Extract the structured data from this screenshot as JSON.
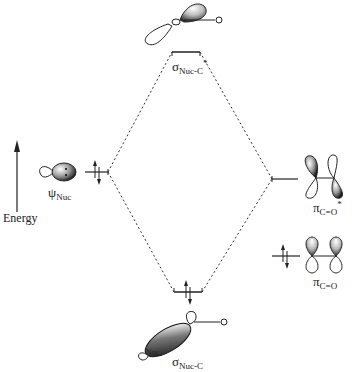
{
  "diagram": {
    "type": "molecular-orbital-energy-diagram",
    "axis": {
      "label": "Energy",
      "direction": "up"
    },
    "levels": [
      {
        "id": "psi_nuc",
        "symbol": "ψ",
        "subscript": "Nuc",
        "superscript": "",
        "electrons": 2,
        "column": "left"
      },
      {
        "id": "sigma_star",
        "symbol": "σ",
        "subscript": "Nuc-C",
        "superscript": "*",
        "electrons": 0,
        "column": "center-top"
      },
      {
        "id": "sigma",
        "symbol": "σ",
        "subscript": "Nuc-C",
        "superscript": "",
        "electrons": 2,
        "column": "center-bottom"
      },
      {
        "id": "pi_star",
        "symbol": "π",
        "subscript": "C=O",
        "superscript": "*",
        "electrons": 0,
        "column": "right"
      },
      {
        "id": "pi",
        "symbol": "π",
        "subscript": "C=O",
        "superscript": "",
        "electrons": 2,
        "column": "right-low"
      }
    ],
    "orbital_labels": {
      "o_top": "O",
      "o_bottom": "O",
      "nuc_bottom": "Nuc"
    },
    "colors": {
      "line": "#222222",
      "dashed": "#333333",
      "lobe_fill": "#9a9a9a"
    }
  }
}
